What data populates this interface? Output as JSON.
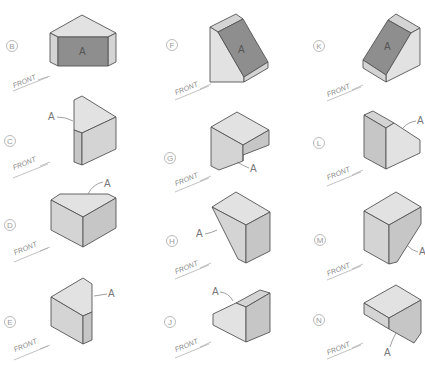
{
  "figure": {
    "surface_label": "A",
    "front_label": "FRONT",
    "colors": {
      "background": "#ffffff",
      "surface_A": "#8e8e8e",
      "light_face": "#e2e2e2",
      "mid_face": "#d4d4d4",
      "dark_face": "#c6c6c6",
      "edge": "#555555"
    },
    "items": [
      {
        "id": "B",
        "column": 1,
        "row": 1,
        "surface_A_shaded": true
      },
      {
        "id": "C",
        "column": 1,
        "row": 2,
        "surface_A_shaded": false
      },
      {
        "id": "D",
        "column": 1,
        "row": 3,
        "surface_A_shaded": false
      },
      {
        "id": "E",
        "column": 1,
        "row": 4,
        "surface_A_shaded": false
      },
      {
        "id": "F",
        "column": 2,
        "row": 1,
        "surface_A_shaded": true
      },
      {
        "id": "G",
        "column": 2,
        "row": 2,
        "surface_A_shaded": false
      },
      {
        "id": "H",
        "column": 2,
        "row": 3,
        "surface_A_shaded": false
      },
      {
        "id": "J",
        "column": 2,
        "row": 4,
        "surface_A_shaded": false
      },
      {
        "id": "K",
        "column": 3,
        "row": 1,
        "surface_A_shaded": true
      },
      {
        "id": "L",
        "column": 3,
        "row": 2,
        "surface_A_shaded": false
      },
      {
        "id": "M",
        "column": 3,
        "row": 3,
        "surface_A_shaded": false
      },
      {
        "id": "N",
        "column": 3,
        "row": 4,
        "surface_A_shaded": false
      }
    ]
  }
}
